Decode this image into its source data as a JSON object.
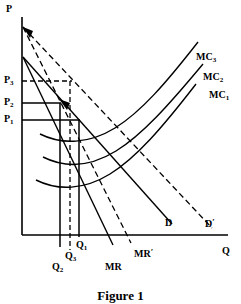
{
  "figure": {
    "caption": "Figure 1",
    "axes": {
      "y_label": "P",
      "x_label": "Q"
    },
    "price_ticks": [
      {
        "id": "P3",
        "base": "P",
        "sub": "3",
        "y": 81,
        "line_style": "dashed"
      },
      {
        "id": "P2",
        "base": "P",
        "sub": "2",
        "y": 103,
        "line_style": "solid"
      },
      {
        "id": "P1",
        "base": "P",
        "sub": "1",
        "y": 120,
        "line_style": "solid"
      }
    ],
    "quantity_ticks": [
      {
        "id": "Q1",
        "base": "Q",
        "sub": "1",
        "x": 79,
        "line_style": "solid"
      },
      {
        "id": "Q3",
        "base": "Q",
        "sub": "3",
        "x": 69,
        "line_style": "dashed"
      },
      {
        "id": "Q2",
        "base": "Q",
        "sub": "2",
        "x": 60,
        "line_style": "solid"
      }
    ],
    "curves": [
      {
        "id": "MC1",
        "base": "MC",
        "sub": "1",
        "style": "solid",
        "type": "marginal-cost"
      },
      {
        "id": "MC2",
        "base": "MC",
        "sub": "2",
        "style": "solid",
        "type": "marginal-cost"
      },
      {
        "id": "MC3",
        "base": "MC",
        "sub": "3",
        "style": "solid",
        "type": "marginal-cost"
      },
      {
        "id": "D",
        "base": "D",
        "prime": "",
        "style": "solid",
        "type": "demand"
      },
      {
        "id": "Dprime",
        "base": "D",
        "prime": "′",
        "style": "dashed",
        "type": "demand-shifted"
      },
      {
        "id": "MR",
        "base": "MR",
        "prime": "",
        "style": "solid",
        "type": "marginal-revenue"
      },
      {
        "id": "MRprime",
        "base": "MR",
        "prime": "′",
        "style": "dashed",
        "type": "marginal-revenue-shifted"
      }
    ],
    "labels": {
      "p_axis": "P",
      "q_axis": "Q",
      "p3": "P",
      "p3_sub": "3",
      "p2": "P",
      "p2_sub": "2",
      "p1": "P",
      "p1_sub": "1",
      "q1": "Q",
      "q1_sub": "1",
      "q2": "Q",
      "q2_sub": "2",
      "q3": "Q",
      "q3_sub": "3",
      "mc1": "MC",
      "mc1_sub": "1",
      "mc2": "MC",
      "mc2_sub": "2",
      "mc3": "MC",
      "mc3_sub": "3",
      "d": "D",
      "d_prime": "D",
      "d_prime_mark": "′",
      "mr": "MR",
      "mr_prime": "MR",
      "mr_prime_mark": "′"
    },
    "colors": {
      "ink": "#000000",
      "background": "#ffffff"
    }
  }
}
